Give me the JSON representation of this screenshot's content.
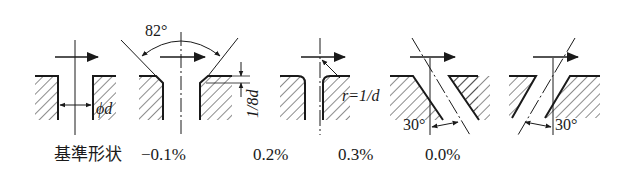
{
  "figure": {
    "colors": {
      "ink": "#1a1a1a",
      "background": "#ffffff"
    },
    "shapes": [
      {
        "id": "reference",
        "caption": "基準形状",
        "annotation": "ϕd",
        "description": "square sharp-edged bore, diameter d"
      },
      {
        "id": "chamfer-82",
        "caption": "−0.1%",
        "annotation_angle": "82°",
        "annotation_depth": "1/8d",
        "description": "82° countersink chamfer of depth 1/8 d"
      },
      {
        "id": "rounded",
        "caption": "0.2%",
        "annotation": "r=1/d",
        "description": "rounded inlet edge with radius r"
      },
      {
        "id": "inclined-forward",
        "caption": "0.3%",
        "annotation_angle": "30°",
        "description": "bore inclined 30° from axis"
      },
      {
        "id": "inclined-backward",
        "caption": "0.0%",
        "annotation_angle": "30°",
        "description": "bore inclined 30° opposite direction"
      }
    ]
  }
}
